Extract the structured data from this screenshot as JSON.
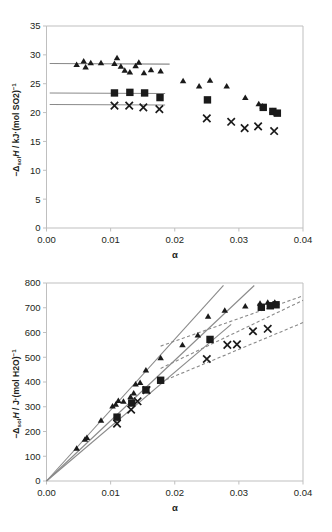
{
  "figure": {
    "panels": [
      "top",
      "bottom"
    ]
  },
  "chart_data": [
    {
      "id": "top",
      "type": "scatter",
      "title": "",
      "xlabel": "α",
      "ylabel": "−ΔsolH / kJ·(mol SO2)⁻¹",
      "ylabel_parts": {
        "minus": "−Δ",
        "sub": "sol",
        "italic": "H",
        "tail": " / kJ·(mol SO2)",
        "sup": "−1"
      },
      "xlim": [
        0.0,
        0.04
      ],
      "ylim": [
        0,
        35
      ],
      "xticks": [
        0.0,
        0.01,
        0.02,
        0.03,
        0.04
      ],
      "xticklabels": [
        "0.00",
        "0.01",
        "0.02",
        "0.03",
        "0.04"
      ],
      "yticks": [
        0,
        5,
        10,
        15,
        20,
        25,
        30,
        35
      ],
      "yticklabels": [
        "0",
        "5",
        "10",
        "15",
        "20",
        "25",
        "30",
        "35"
      ],
      "grid": false,
      "legend": "none",
      "series": [
        {
          "name": "triangle",
          "marker": "triangle",
          "color": "#1a1a1a",
          "points": [
            [
              0.0047,
              28.3
            ],
            [
              0.0058,
              28.9
            ],
            [
              0.0061,
              27.9
            ],
            [
              0.0069,
              28.6
            ],
            [
              0.0085,
              28.6
            ],
            [
              0.0106,
              28.5
            ],
            [
              0.011,
              29.5
            ],
            [
              0.0116,
              28.0
            ],
            [
              0.0122,
              27.3
            ],
            [
              0.013,
              27.0
            ],
            [
              0.0139,
              28.1
            ],
            [
              0.0144,
              28.7
            ],
            [
              0.0152,
              26.9
            ],
            [
              0.0163,
              27.4
            ],
            [
              0.0178,
              27.2
            ],
            [
              0.0213,
              25.5
            ],
            [
              0.0238,
              24.6
            ],
            [
              0.0255,
              25.6
            ],
            [
              0.0281,
              24.6
            ],
            [
              0.031,
              22.6
            ],
            [
              0.0331,
              21.5
            ],
            [
              0.0337,
              21.1
            ],
            [
              0.0352,
              20.3
            ],
            [
              0.0358,
              19.9
            ]
          ]
        },
        {
          "name": "square",
          "marker": "square",
          "color": "#1a1a1a",
          "points": [
            [
              0.0106,
              23.4
            ],
            [
              0.013,
              23.5
            ],
            [
              0.0153,
              23.4
            ],
            [
              0.0177,
              22.6
            ],
            [
              0.0251,
              22.2
            ],
            [
              0.0338,
              20.9
            ],
            [
              0.0353,
              20.2
            ],
            [
              0.036,
              19.9
            ]
          ]
        },
        {
          "name": "cross",
          "marker": "x",
          "color": "#1a1a1a",
          "points": [
            [
              0.0106,
              21.2
            ],
            [
              0.0129,
              21.2
            ],
            [
              0.0151,
              20.9
            ],
            [
              0.0176,
              20.6
            ],
            [
              0.025,
              19.0
            ],
            [
              0.0288,
              18.4
            ],
            [
              0.0309,
              17.3
            ],
            [
              0.033,
              17.6
            ],
            [
              0.0355,
              16.8
            ]
          ]
        }
      ],
      "fits": [
        {
          "name": "triangle-plateau",
          "style": "solid",
          "x": [
            0.0005,
            0.0192
          ],
          "y": [
            28.5,
            28.4
          ]
        },
        {
          "name": "square-plateau",
          "style": "solid",
          "x": [
            0.0005,
            0.0185
          ],
          "y": [
            23.4,
            23.3
          ]
        },
        {
          "name": "cross-plateau",
          "style": "solid",
          "x": [
            0.0005,
            0.0185
          ],
          "y": [
            21.4,
            21.3
          ]
        }
      ]
    },
    {
      "id": "bottom",
      "type": "scatter",
      "title": "",
      "xlabel": "α",
      "ylabel": "−ΔsolH / J·(mol H2O)⁻¹",
      "ylabel_parts": {
        "minus": "−Δ",
        "sub": "sol",
        "italic": "H",
        "tail": " / J·(mol H2O)",
        "sup": "−1"
      },
      "xlim": [
        0.0,
        0.04
      ],
      "ylim": [
        0,
        800
      ],
      "xticks": [
        0.0,
        0.01,
        0.02,
        0.03,
        0.04
      ],
      "xticklabels": [
        "0.00",
        "0.01",
        "0.02",
        "0.03",
        "0.04"
      ],
      "yticks": [
        0,
        100,
        200,
        300,
        400,
        500,
        600,
        700,
        800
      ],
      "yticklabels": [
        "0",
        "100",
        "200",
        "300",
        "400",
        "500",
        "600",
        "700",
        "800"
      ],
      "grid": false,
      "legend": "none",
      "series": [
        {
          "name": "triangle",
          "marker": "triangle",
          "color": "#1a1a1a",
          "points": [
            [
              0.0047,
              132
            ],
            [
              0.006,
              168
            ],
            [
              0.0063,
              175
            ],
            [
              0.0085,
              245
            ],
            [
              0.0103,
              303
            ],
            [
              0.0108,
              310
            ],
            [
              0.0112,
              325
            ],
            [
              0.012,
              322
            ],
            [
              0.0131,
              340
            ],
            [
              0.0136,
              355
            ],
            [
              0.0139,
              392
            ],
            [
              0.0146,
              398
            ],
            [
              0.0155,
              448
            ],
            [
              0.0178,
              498
            ],
            [
              0.0212,
              550
            ],
            [
              0.0236,
              590
            ],
            [
              0.0252,
              665
            ],
            [
              0.0278,
              690
            ],
            [
              0.031,
              707
            ],
            [
              0.0333,
              718
            ],
            [
              0.0345,
              722
            ],
            [
              0.0356,
              722
            ]
          ]
        },
        {
          "name": "square",
          "marker": "square",
          "color": "#1a1a1a",
          "points": [
            [
              0.011,
              258
            ],
            [
              0.0133,
              315
            ],
            [
              0.0155,
              368
            ],
            [
              0.0178,
              407
            ],
            [
              0.0255,
              572
            ],
            [
              0.0335,
              702
            ],
            [
              0.0349,
              708
            ],
            [
              0.0358,
              712
            ]
          ]
        },
        {
          "name": "cross",
          "marker": "x",
          "color": "#1a1a1a",
          "points": [
            [
              0.011,
              232
            ],
            [
              0.0132,
              288
            ],
            [
              0.0142,
              322
            ],
            [
              0.0156,
              367
            ],
            [
              0.025,
              493
            ],
            [
              0.0282,
              550
            ],
            [
              0.0297,
              552
            ],
            [
              0.0322,
              605
            ],
            [
              0.0345,
              615
            ]
          ]
        }
      ],
      "fits": [
        {
          "name": "triangle-linear",
          "style": "solid",
          "x": [
            0.0,
            0.0276
          ],
          "y": [
            0,
            790
          ]
        },
        {
          "name": "square-linear",
          "style": "solid",
          "x": [
            0.0,
            0.0324
          ],
          "y": [
            0,
            790
          ]
        },
        {
          "name": "cross-linear",
          "style": "solid",
          "x": [
            0.0,
            0.0288
          ],
          "y": [
            0,
            633
          ]
        },
        {
          "name": "triangle-curve",
          "style": "dashed",
          "x": [
            0.0178,
            0.04
          ],
          "y": [
            545,
            748
          ]
        },
        {
          "name": "square-curve",
          "style": "dashed",
          "x": [
            0.0178,
            0.04
          ],
          "y": [
            455,
            730
          ]
        },
        {
          "name": "cross-curve",
          "style": "dashed",
          "x": [
            0.0178,
            0.04
          ],
          "y": [
            400,
            640
          ]
        }
      ]
    }
  ]
}
